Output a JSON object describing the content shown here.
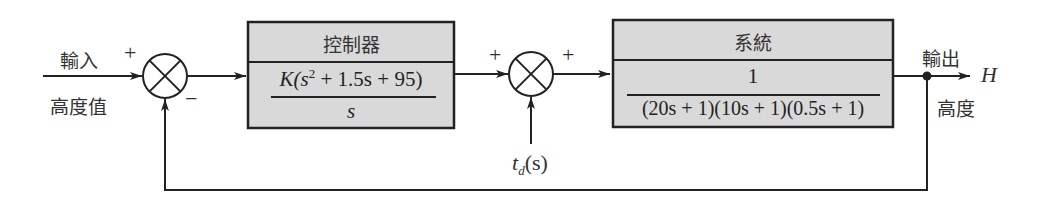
{
  "diagram": {
    "type": "feedback-control-block-diagram",
    "input": {
      "label_top": "輸入",
      "label_bottom": "高度值"
    },
    "summing_junction_1": {
      "sign_top": "+",
      "sign_bottom": "−"
    },
    "controller": {
      "title": "控制器",
      "numerator_prefix": "K(s",
      "numerator_exp": "2",
      "numerator_suffix": " + 1.5s + 95)",
      "denominator": "s"
    },
    "summing_junction_2": {
      "sign_left": "+",
      "sign_right": "+",
      "disturbance_label": "t",
      "disturbance_sub": "d",
      "disturbance_arg": "(s)"
    },
    "system": {
      "title": "系統",
      "numerator": "1",
      "denominator": "(20s + 1)(10s + 1)(0.5s + 1)"
    },
    "output": {
      "label_top": "輸出",
      "label_bottom": "高度",
      "symbol": "H"
    },
    "colors": {
      "box_fill": "#d9d9d9",
      "line": "#222222",
      "background": "#ffffff"
    }
  }
}
